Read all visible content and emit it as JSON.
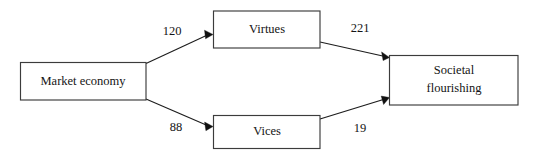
{
  "diagram": {
    "type": "path-model",
    "title": "",
    "nodes": [
      {
        "id": "market_economy",
        "label": "Market economy",
        "label_lines": [
          "Market economy"
        ]
      },
      {
        "id": "virtues",
        "label": "Virtues",
        "label_lines": [
          "Virtues"
        ]
      },
      {
        "id": "vices",
        "label": "Vices",
        "label_lines": [
          "Vices"
        ]
      },
      {
        "id": "societal_flourishing",
        "label": "Societal flourishing",
        "label_lines": [
          "Societal",
          "flourishing"
        ]
      }
    ],
    "edges": [
      {
        "id": "e1",
        "from": "market_economy",
        "to": "virtues",
        "label": "120"
      },
      {
        "id": "e2",
        "from": "market_economy",
        "to": "vices",
        "label": "88"
      },
      {
        "id": "e3",
        "from": "virtues",
        "to": "societal_flourishing",
        "label": "221"
      },
      {
        "id": "e4",
        "from": "vices",
        "to": "societal_flourishing",
        "label": "19"
      }
    ],
    "colors": {
      "box_stroke": "#3c3c3c",
      "line_stroke": "#1d1d1d",
      "text": "#141414",
      "background": "#ffffff"
    }
  }
}
